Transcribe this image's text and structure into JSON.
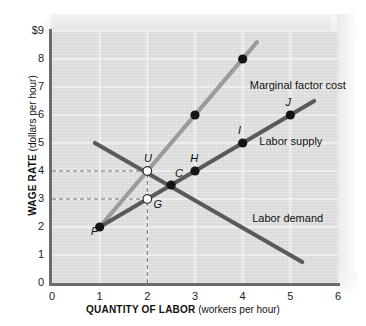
{
  "chart_data": {
    "type": "line",
    "title": "",
    "xlabel_bold": "QUANTITY OF LABOR",
    "xlabel_paren": "(workers per hour)",
    "ylabel_bold": "WAGE RATE",
    "ylabel_paren": "(dollars per hour)",
    "xlim": [
      0,
      6
    ],
    "ylim": [
      0,
      9
    ],
    "xticks": [
      "0",
      "1",
      "2",
      "3",
      "4",
      "5",
      "6"
    ],
    "yticks": [
      "0",
      "1",
      "2",
      "3",
      "4",
      "5",
      "6",
      "7",
      "8",
      "$9"
    ],
    "grid": true,
    "legend": "inline-labels",
    "series": [
      {
        "name": "Marginal factor cost",
        "color": "#9b9b9b",
        "label_x": 4.15,
        "label_y": 7.05,
        "x": [
          1,
          4.3
        ],
        "y": [
          2,
          8.6
        ],
        "points": [
          {
            "x": 3,
            "y": 6,
            "style": "filled",
            "label": ""
          },
          {
            "x": 4,
            "y": 8,
            "style": "filled",
            "label": ""
          }
        ]
      },
      {
        "name": "Labor supply",
        "color": "#5a5a5a",
        "label_x": 4.35,
        "label_y": 5.05,
        "x": [
          1,
          5.5
        ],
        "y": [
          2,
          6.5
        ],
        "points": [
          {
            "x": 1,
            "y": 2,
            "style": "filled",
            "label": "F"
          },
          {
            "x": 2,
            "y": 3,
            "style": "open",
            "label": "G"
          },
          {
            "x": 2.5,
            "y": 3.5,
            "style": "filled",
            "label": "C"
          },
          {
            "x": 3,
            "y": 4,
            "style": "filled",
            "label": "H"
          },
          {
            "x": 4,
            "y": 5,
            "style": "filled",
            "label": "I"
          },
          {
            "x": 5,
            "y": 6,
            "style": "filled",
            "label": "J"
          }
        ]
      },
      {
        "name": "Labor demand",
        "color": "#5a5a5a",
        "label_x": 4.2,
        "label_y": 2.3,
        "x": [
          0.9,
          5.25
        ],
        "y": [
          5.0,
          0.75
        ],
        "points": [
          {
            "x": 2,
            "y": 4,
            "style": "open",
            "label": "U"
          }
        ]
      }
    ],
    "guide_lines": [
      {
        "name": "wage-4-guide",
        "from": [
          0,
          4
        ],
        "to": [
          2,
          4
        ],
        "style": "dashed"
      },
      {
        "name": "wage-3-guide",
        "from": [
          0,
          3
        ],
        "to": [
          2,
          3
        ],
        "style": "dashed"
      },
      {
        "name": "quantity-2-guide",
        "from": [
          2,
          0
        ],
        "to": [
          2,
          4
        ],
        "style": "dashed"
      }
    ],
    "annotations": [
      {
        "text": "Marginal factor cost",
        "x": 4.15,
        "y": 7.05
      },
      {
        "text": "Labor supply",
        "x": 4.35,
        "y": 5.05
      },
      {
        "text": "Labor demand",
        "x": 4.2,
        "y": 2.3
      }
    ],
    "point_labels": [
      {
        "text": "F",
        "x": 0.82,
        "y": 1.82
      },
      {
        "text": "G",
        "x": 2.13,
        "y": 2.78
      },
      {
        "text": "U",
        "x": 1.93,
        "y": 4.42
      },
      {
        "text": "C",
        "x": 2.58,
        "y": 3.88
      },
      {
        "text": "H",
        "x": 2.9,
        "y": 4.42
      },
      {
        "text": "I",
        "x": 3.9,
        "y": 5.42
      },
      {
        "text": "J",
        "x": 4.9,
        "y": 6.42
      }
    ]
  },
  "colors": {
    "panel": "#e2e2e2",
    "axis": "#6b6b6b",
    "grid": "#f2f2f2",
    "mfc": "#9b9b9b",
    "supply": "#5a5a5a",
    "demand": "#5a5a5a",
    "guide": "#6e6e6e",
    "text": "#111111"
  }
}
